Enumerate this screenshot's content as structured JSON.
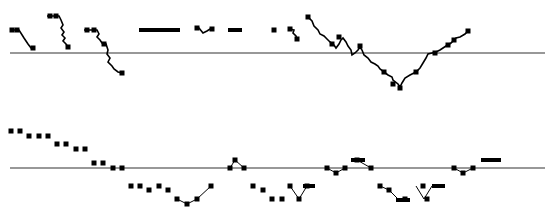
{
  "figure": {
    "width": 554,
    "height": 212,
    "background": "#ffffff",
    "ink": "#000000",
    "axis_color": "#333333"
  },
  "chart_data": [
    {
      "type": "line",
      "title": "",
      "xlabel": "",
      "ylabel": "",
      "grid": false,
      "legend": "none",
      "baseline": {
        "y": 53,
        "x1": 10,
        "x2": 545
      },
      "note": "Pixel-space trace segments relative to zero baseline (upper panel)",
      "segments": [
        {
          "points": [
            [
              10,
              30
            ],
            [
              19,
              30
            ],
            [
              24,
              38
            ],
            [
              28,
              44
            ],
            [
              31,
              48
            ],
            [
              34,
              48
            ]
          ],
          "markers": [
            [
              12,
              30
            ],
            [
              17,
              30
            ],
            [
              33,
              48
            ]
          ]
        },
        {
          "points": [
            [
              47,
              16
            ],
            [
              59,
              16
            ],
            [
              61,
              20
            ],
            [
              63,
              25
            ],
            [
              61,
              28
            ],
            [
              64,
              32
            ],
            [
              62,
              35
            ],
            [
              65,
              38
            ],
            [
              63,
              41
            ],
            [
              66,
              44
            ],
            [
              68,
              47
            ]
          ],
          "markers": [
            [
              50,
              16
            ],
            [
              56,
              16
            ],
            [
              68,
              47
            ]
          ]
        },
        {
          "points": [
            [
              84,
              30
            ],
            [
              97,
              30
            ],
            [
              99,
              34
            ],
            [
              97,
              37
            ],
            [
              100,
              40
            ],
            [
              102,
              43
            ],
            [
              106,
              44
            ],
            [
              108,
              50
            ],
            [
              107,
              54
            ],
            [
              110,
              58
            ],
            [
              108,
              62
            ],
            [
              112,
              66
            ],
            [
              114,
              69
            ],
            [
              118,
              72
            ],
            [
              122,
              73
            ]
          ],
          "markers": [
            [
              87,
              30
            ],
            [
              94,
              30
            ],
            [
              104,
              44
            ],
            [
              122,
              73
            ]
          ]
        },
        {
          "points": [
            [
              139,
              30
            ],
            [
              180,
              30
            ]
          ],
          "markers": []
        },
        {
          "points": [
            [
              196,
              28
            ],
            [
              199,
              28
            ],
            [
              203,
              33
            ],
            [
              207,
              31
            ],
            [
              210,
              29
            ],
            [
              214,
              29
            ]
          ],
          "markers": [
            [
              197,
              28
            ],
            [
              212,
              29
            ]
          ]
        },
        {
          "points": [
            [
              228,
              30
            ],
            [
              242,
              30
            ]
          ],
          "markers": []
        },
        {
          "points": [
            [
              274,
              30
            ],
            [
              274,
              30
            ]
          ],
          "markers": [
            [
              274,
              30
            ]
          ]
        },
        {
          "points": [
            [
              290,
              29
            ],
            [
              294,
              30
            ],
            [
              293,
              33
            ],
            [
              296,
              36
            ],
            [
              297,
              39
            ]
          ],
          "markers": [
            [
              290,
              29
            ],
            [
              297,
              39
            ]
          ]
        },
        {
          "points": [
            [
              308,
              17
            ],
            [
              312,
              21
            ],
            [
              314,
              26
            ],
            [
              318,
              30
            ],
            [
              320,
              34
            ],
            [
              324,
              36
            ],
            [
              327,
              39
            ],
            [
              330,
              42
            ],
            [
              334,
              45
            ],
            [
              336,
              48
            ],
            [
              339,
              44
            ],
            [
              341,
              40
            ],
            [
              343,
              38
            ],
            [
              346,
              42
            ],
            [
              348,
              46
            ],
            [
              351,
              50
            ],
            [
              352,
              55
            ],
            [
              355,
              53
            ],
            [
              358,
              50
            ],
            [
              360,
              47
            ],
            [
              362,
              50
            ],
            [
              364,
              55
            ],
            [
              368,
              58
            ],
            [
              371,
              62
            ],
            [
              375,
              64
            ],
            [
              378,
              66
            ],
            [
              380,
              69
            ],
            [
              384,
              72
            ],
            [
              388,
              75
            ],
            [
              392,
              77
            ],
            [
              393,
              80
            ],
            [
              398,
              84
            ],
            [
              400,
              87
            ],
            [
              402,
              83
            ],
            [
              405,
              78
            ],
            [
              410,
              75
            ],
            [
              416,
              72
            ],
            [
              420,
              68
            ],
            [
              423,
              63
            ],
            [
              426,
              58
            ],
            [
              428,
              54
            ],
            [
              432,
              53
            ],
            [
              436,
              52
            ],
            [
              440,
              50
            ],
            [
              446,
              46
            ],
            [
              451,
              43
            ],
            [
              456,
              38
            ],
            [
              460,
              37
            ],
            [
              465,
              34
            ],
            [
              468,
              31
            ]
          ],
          "markers": [
            [
              308,
              17
            ],
            [
              332,
              44
            ],
            [
              339,
              37
            ],
            [
              360,
              46
            ],
            [
              384,
              72
            ],
            [
              393,
              84
            ],
            [
              400,
              88
            ],
            [
              416,
              72
            ],
            [
              435,
              53
            ],
            [
              448,
              45
            ],
            [
              454,
              40
            ],
            [
              468,
              31
            ]
          ]
        }
      ]
    },
    {
      "type": "scatter",
      "title": "",
      "xlabel": "",
      "ylabel": "",
      "grid": false,
      "legend": "none",
      "baseline": {
        "y": 168,
        "x1": 10,
        "x2": 545
      },
      "note": "Pixel-space markers and connecting segments (lower panel)",
      "markers": [
        [
          11,
          131
        ],
        [
          20,
          131
        ],
        [
          29,
          136
        ],
        [
          39,
          136
        ],
        [
          48,
          136
        ],
        [
          57,
          144
        ],
        [
          66,
          144
        ],
        [
          76,
          149
        ],
        [
          85,
          149
        ],
        [
          94,
          163
        ],
        [
          103,
          163
        ],
        [
          113,
          168
        ],
        [
          122,
          168
        ],
        [
          131,
          186
        ],
        [
          140,
          186
        ],
        [
          149,
          190
        ],
        [
          159,
          186
        ],
        [
          168,
          190
        ],
        [
          177,
          199
        ],
        [
          187,
          204
        ],
        [
          197,
          199
        ],
        [
          211,
          186
        ],
        [
          230,
          168
        ],
        [
          235,
          160
        ],
        [
          244,
          168
        ],
        [
          253,
          186
        ],
        [
          263,
          190
        ],
        [
          272,
          199
        ],
        [
          282,
          199
        ],
        [
          290,
          186
        ],
        [
          299,
          199
        ],
        [
          307,
          186
        ],
        [
          327,
          168
        ],
        [
          336,
          173
        ],
        [
          345,
          168
        ],
        [
          357,
          160
        ],
        [
          371,
          168
        ],
        [
          380,
          186
        ],
        [
          389,
          190
        ],
        [
          405,
          199
        ],
        [
          423,
          186
        ],
        [
          427,
          199
        ],
        [
          454,
          168
        ],
        [
          463,
          173
        ],
        [
          473,
          168
        ]
      ],
      "lines": [
        [
          [
            230,
            168
          ],
          [
            235,
            160
          ],
          [
            244,
            168
          ]
        ],
        [
          [
            177,
            199
          ],
          [
            187,
            204
          ],
          [
            197,
            199
          ],
          [
            211,
            186
          ]
        ],
        [
          [
            290,
            186
          ],
          [
            299,
            199
          ],
          [
            307,
            186
          ]
        ],
        [
          [
            327,
            168
          ],
          [
            336,
            173
          ],
          [
            345,
            168
          ]
        ],
        [
          [
            357,
            160
          ],
          [
            371,
            168
          ]
        ],
        [
          [
            380,
            186
          ],
          [
            389,
            190
          ],
          [
            398,
            199
          ]
        ],
        [
          [
            416,
            186
          ],
          [
            424,
            199
          ],
          [
            432,
            186
          ]
        ],
        [
          [
            454,
            168
          ],
          [
            463,
            173
          ],
          [
            473,
            168
          ]
        ]
      ],
      "bars": [
        [
          303,
          184,
          12,
          4
        ],
        [
          351,
          158,
          14,
          4
        ],
        [
          396,
          198,
          14,
          4
        ],
        [
          432,
          184,
          13,
          4
        ],
        [
          481,
          158,
          20,
          4
        ]
      ]
    }
  ]
}
